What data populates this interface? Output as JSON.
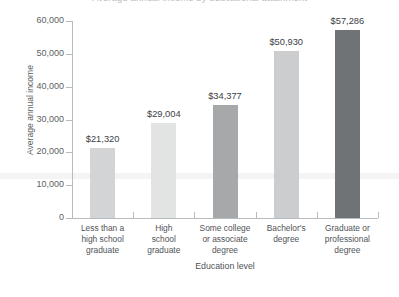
{
  "chart_data": {
    "type": "bar",
    "title": "Average annual income by educational attainment",
    "xlabel": "Education level",
    "ylabel": "Average annual income",
    "ylim": [
      0,
      60000
    ],
    "ytick_labels": [
      "0",
      "10,000",
      "20,000",
      "30,000",
      "40,000",
      "50,000",
      "60,000"
    ],
    "ytick_values": [
      0,
      10000,
      20000,
      30000,
      40000,
      50000,
      60000
    ],
    "grid": false,
    "legend": "none",
    "categories": [
      "Less than a\nhigh school\ngraduate",
      "High\nschool\ngraduate",
      "Some college\nor associate\ndegree",
      "Bachelor's\ndegree",
      "Graduate or\nprofessional\ndegree"
    ],
    "values": [
      21320,
      29004,
      34377,
      50930,
      57286
    ],
    "data_labels": [
      "$21,320",
      "$29,004",
      "$34,377",
      "$50,930",
      "$57,286"
    ],
    "bar_colors": [
      "#d3d4d5",
      "#e2e3e3",
      "#a6a8aa",
      "#cccdce",
      "#6f7376"
    ]
  },
  "axes": {
    "axis_line_color": "#b7bcc0",
    "tick_label_color": "#5b5f63",
    "value_label_color": "#3c4044"
  }
}
